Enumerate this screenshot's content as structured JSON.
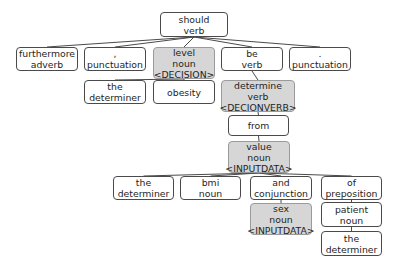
{
  "diagram": {
    "type": "dependency-parse-tree",
    "colors": {
      "border": "#4a4a4a",
      "highlight_fill": "#d6d6d6",
      "highlight_border": "#9a9a9a",
      "edge": "#4a4a4a"
    },
    "nodes": [
      {
        "id": "should",
        "lines": [
          "should",
          "verb"
        ],
        "x": 160,
        "y": 12,
        "w": 68,
        "h": 25,
        "hl": false
      },
      {
        "id": "furthermore",
        "lines": [
          "furthermore",
          "adverb"
        ],
        "x": 16,
        "y": 47,
        "w": 62,
        "h": 24,
        "hl": false
      },
      {
        "id": "comma",
        "lines": [
          ",",
          "punctuation"
        ],
        "x": 84,
        "y": 47,
        "w": 62,
        "h": 24,
        "hl": false
      },
      {
        "id": "level",
        "lines": [
          "level",
          "noun",
          "<DECISION>"
        ],
        "x": 153,
        "y": 47,
        "w": 62,
        "h": 32,
        "hl": true
      },
      {
        "id": "be",
        "lines": [
          "be",
          "verb"
        ],
        "x": 221,
        "y": 47,
        "w": 62,
        "h": 24,
        "hl": false
      },
      {
        "id": "period",
        "lines": [
          ".",
          "punctuation"
        ],
        "x": 289,
        "y": 47,
        "w": 62,
        "h": 24,
        "hl": false
      },
      {
        "id": "the1",
        "lines": [
          "the",
          "determiner"
        ],
        "x": 84,
        "y": 80,
        "w": 62,
        "h": 24,
        "hl": false
      },
      {
        "id": "obesity",
        "lines": [
          "obesity"
        ],
        "x": 153,
        "y": 80,
        "w": 62,
        "h": 24,
        "hl": false
      },
      {
        "id": "determine",
        "lines": [
          "determine",
          "verb",
          "<DECIONVERB>"
        ],
        "x": 221,
        "y": 80,
        "w": 74,
        "h": 32,
        "hl": true
      },
      {
        "id": "from",
        "lines": [
          "from"
        ],
        "x": 228,
        "y": 115,
        "w": 61,
        "h": 21,
        "hl": false
      },
      {
        "id": "value",
        "lines": [
          "value",
          "noun",
          "<INPUTDATA>"
        ],
        "x": 228,
        "y": 141,
        "w": 62,
        "h": 32,
        "hl": true
      },
      {
        "id": "the2",
        "lines": [
          "the",
          "determiner"
        ],
        "x": 113,
        "y": 176,
        "w": 61,
        "h": 24,
        "hl": false
      },
      {
        "id": "bmi",
        "lines": [
          "bmi",
          "noun"
        ],
        "x": 180,
        "y": 176,
        "w": 61,
        "h": 24,
        "hl": false
      },
      {
        "id": "and",
        "lines": [
          "and",
          "conjunction"
        ],
        "x": 250,
        "y": 176,
        "w": 62,
        "h": 24,
        "hl": false
      },
      {
        "id": "of",
        "lines": [
          "of",
          "preposition"
        ],
        "x": 321,
        "y": 176,
        "w": 61,
        "h": 24,
        "hl": false
      },
      {
        "id": "sex",
        "lines": [
          "sex",
          "noun",
          "<INPUTDATA>"
        ],
        "x": 250,
        "y": 203,
        "w": 62,
        "h": 32,
        "hl": true
      },
      {
        "id": "patient",
        "lines": [
          "patient",
          "noun"
        ],
        "x": 321,
        "y": 202,
        "w": 61,
        "h": 25,
        "hl": false
      },
      {
        "id": "the3",
        "lines": [
          "the",
          "determiner"
        ],
        "x": 321,
        "y": 231,
        "w": 61,
        "h": 25,
        "hl": false
      }
    ],
    "edges": [
      {
        "from": "should",
        "to": "furthermore"
      },
      {
        "from": "should",
        "to": "comma"
      },
      {
        "from": "should",
        "to": "level"
      },
      {
        "from": "should",
        "to": "be"
      },
      {
        "from": "should",
        "to": "period"
      },
      {
        "from": "level",
        "to": "the1"
      },
      {
        "from": "level",
        "to": "obesity"
      },
      {
        "from": "be",
        "to": "determine"
      },
      {
        "from": "determine",
        "to": "from"
      },
      {
        "from": "from",
        "to": "value"
      },
      {
        "from": "value",
        "to": "the2"
      },
      {
        "from": "value",
        "to": "bmi"
      },
      {
        "from": "value",
        "to": "and"
      },
      {
        "from": "value",
        "to": "of"
      },
      {
        "from": "and",
        "to": "sex"
      },
      {
        "from": "of",
        "to": "patient"
      },
      {
        "from": "patient",
        "to": "the3"
      }
    ]
  }
}
